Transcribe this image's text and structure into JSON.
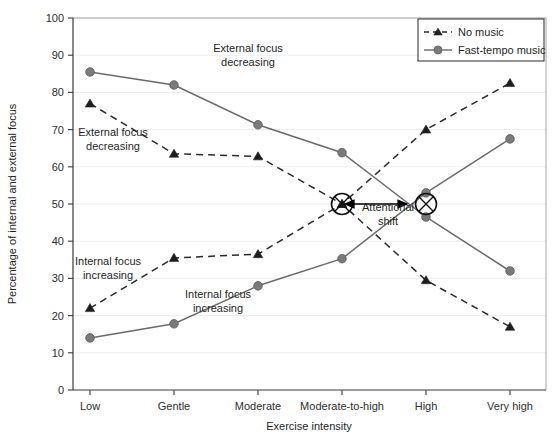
{
  "chart_data": {
    "type": "line",
    "title": "",
    "xlabel": "Exercise intensity",
    "ylabel": "Percentage of internal and external focus",
    "categories": [
      "Low",
      "Gentle",
      "Moderate",
      "Moderate-to-high",
      "High",
      "Very high"
    ],
    "ylim": [
      0,
      100
    ],
    "ytick_labels": [
      "0",
      "10",
      "20",
      "30",
      "40",
      "50",
      "60",
      "70",
      "80",
      "90",
      "100"
    ],
    "yticks": [
      0,
      10,
      20,
      30,
      40,
      50,
      60,
      70,
      80,
      90,
      100
    ],
    "grid": true,
    "grid_axis": "y",
    "legend_position": "top-right",
    "series": [
      {
        "name": "Fast-tempo music",
        "role": "external-focus-decreasing",
        "style": "solid",
        "marker": "circle",
        "color": "#6b6b6b",
        "values": [
          85.5,
          82.0,
          71.3,
          63.8,
          46.5,
          32.0
        ]
      },
      {
        "name": "No music",
        "role": "external-focus-decreasing",
        "style": "dashed",
        "marker": "triangle",
        "color": "#2b2b2b",
        "values": [
          77.0,
          63.5,
          62.8,
          50.0,
          29.5,
          17.0
        ]
      },
      {
        "name": "No music",
        "role": "internal-focus-increasing",
        "style": "dashed",
        "marker": "triangle",
        "color": "#2b2b2b",
        "values": [
          22.0,
          35.5,
          36.5,
          50.0,
          70.0,
          82.5
        ]
      },
      {
        "name": "Fast-tempo music",
        "role": "internal-focus-increasing",
        "style": "solid",
        "marker": "circle",
        "color": "#6b6b6b",
        "values": [
          14.0,
          17.8,
          28.0,
          35.3,
          53.0,
          67.5
        ]
      }
    ],
    "annotations": [
      {
        "id": "external-focus-decreasing-upper",
        "lines": [
          "External focus",
          "decreasing"
        ],
        "x_category": "Gentle-Moderate",
        "y_value": 80
      },
      {
        "id": "external-focus-decreasing-lower",
        "lines": [
          "External focus",
          "decreasing"
        ],
        "x_category": "Low-Gentle",
        "y_value": 67
      },
      {
        "id": "internal-focus-increasing-upper",
        "lines": [
          "Internal focus",
          "increasing"
        ],
        "x_category": "Low-Gentle",
        "y_value": 42
      },
      {
        "id": "internal-focus-increasing-lower",
        "lines": [
          "Internal focus",
          "increasing"
        ],
        "x_category": "Gentle-Moderate",
        "y_value": 23
      },
      {
        "id": "attentional-shift",
        "lines": [
          "Attentional",
          "shift"
        ],
        "x_category": "Moderate-to-high",
        "y_value": 48
      }
    ],
    "crossing_markers": [
      {
        "id": "crossing-left",
        "x_category": "Moderate-to-high",
        "y_value": 50
      },
      {
        "id": "crossing-right",
        "x_category": "High",
        "y_value": 50
      }
    ]
  },
  "legend": {
    "entries": [
      {
        "label": "No music",
        "marker": "triangle",
        "style": "dashed"
      },
      {
        "label": "Fast-tempo music",
        "marker": "circle",
        "style": "solid"
      }
    ]
  },
  "axes": {
    "y_title": "Percentage of internal and external focus",
    "x_title": "Exercise intensity"
  },
  "colors": {
    "solid_series": "#6b6b6b",
    "dashed_series": "#2b2b2b",
    "marker_circle": "#7a7a7a",
    "marker_triangle": "#1e1e1e",
    "grid": "#ededed",
    "axis": "#3a3a3a",
    "text": "#1f1f1f",
    "background": "#ffffff"
  }
}
